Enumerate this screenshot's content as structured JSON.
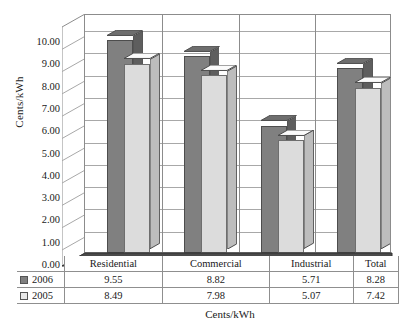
{
  "chart_data": {
    "type": "bar",
    "title": "",
    "subtitle": "",
    "xlabel": "Cents/kWh",
    "ylabel": "Cents/kWh",
    "ylim": [
      0,
      10
    ],
    "ytick_step": 1,
    "yticks": [
      "10.00",
      "9.00",
      "8.00",
      "7.00",
      "6.00",
      "5.00",
      "4.00",
      "3.00",
      "2.00",
      "1.00",
      "0.00"
    ],
    "categories": [
      "Residential",
      "Commercial",
      "Industrial",
      "Total"
    ],
    "series": [
      {
        "name": "2006",
        "color": "#808080",
        "values": [
          9.55,
          8.82,
          5.71,
          8.28
        ]
      },
      {
        "name": "2005",
        "color": "#e8e8e8",
        "values": [
          8.49,
          7.98,
          5.07,
          7.42
        ]
      }
    ],
    "grid": true,
    "legend_position": "table-left",
    "style": "3d-column",
    "data_table_visible": true
  },
  "table": {
    "header_row": [
      "",
      "Residential",
      "Commercial",
      "Industrial",
      "Total"
    ],
    "rows": [
      {
        "label": "2006",
        "swatch": "dark",
        "cells": [
          "9.55",
          "8.82",
          "5.71",
          "8.28"
        ]
      },
      {
        "label": "2005",
        "swatch": "light",
        "cells": [
          "8.49",
          "7.98",
          "5.07",
          "7.42"
        ]
      }
    ]
  },
  "axis": {
    "y_title": "Cents/kWh",
    "x_title": "Cents/kWh"
  }
}
